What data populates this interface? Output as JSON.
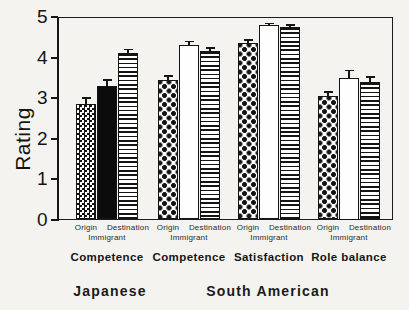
{
  "chart_data": {
    "type": "bar",
    "title": "",
    "ylabel": "Rating",
    "xlabel": "",
    "ylim": [
      0,
      5
    ],
    "yticks": [
      0,
      1,
      2,
      3,
      4,
      5
    ],
    "grid": false,
    "legend": "none",
    "bar_labels": [
      "Origin",
      "Immigrant",
      "Destination"
    ],
    "groups": [
      {
        "label": "Competence",
        "cluster": "Japanese",
        "values": [
          2.85,
          3.3,
          4.1
        ],
        "errors": [
          0.15,
          0.15,
          0.1
        ],
        "patterns": [
          "fine-checkerboard",
          "solid-black",
          "horizontal-stripes"
        ]
      },
      {
        "label": "Competence",
        "cluster": "South American",
        "values": [
          3.45,
          4.3,
          4.15
        ],
        "errors": [
          0.1,
          0.1,
          0.08
        ],
        "patterns": [
          "diamond-dots",
          "white",
          "horizontal-stripes"
        ]
      },
      {
        "label": "Satisfaction",
        "cluster": "South American",
        "values": [
          4.35,
          4.8,
          4.75
        ],
        "errors": [
          0.08,
          0.04,
          0.05
        ],
        "patterns": [
          "diamond-dots",
          "white",
          "horizontal-stripes"
        ]
      },
      {
        "label": "Role balance",
        "cluster": "South American",
        "values": [
          3.05,
          3.5,
          3.4
        ],
        "errors": [
          0.1,
          0.18,
          0.12
        ],
        "patterns": [
          "diamond-dots",
          "white",
          "horizontal-stripes"
        ]
      }
    ],
    "cluster_labels": [
      "Japanese",
      "South American"
    ]
  },
  "colors": {
    "ink": "#141414",
    "background": "#f4f3ef",
    "bar_fill_white": "#fefefe",
    "bar_fill_black": "#0c0c0c"
  }
}
